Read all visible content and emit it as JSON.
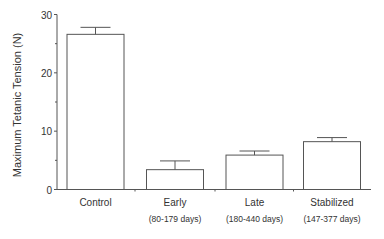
{
  "chart_data": {
    "type": "bar",
    "title": "",
    "xlabel": "",
    "ylabel": "Maximum Tetanic Tension (N)",
    "ylim": [
      0,
      30
    ],
    "yticks": [
      0,
      10,
      20,
      30
    ],
    "grid": false,
    "legend": null,
    "categories": [
      "Control",
      "Early",
      "Late",
      "Stabilized"
    ],
    "sublabels": [
      "",
      "(80-179 days)",
      "(180-440 days)",
      "(147-377 days)"
    ],
    "values": [
      26.6,
      3.4,
      5.9,
      8.2
    ],
    "error_upper": [
      27.8,
      4.9,
      6.6,
      8.9
    ]
  },
  "colors": {
    "axis": "#555555",
    "bar_fill": "#ffffff",
    "bar_stroke": "#555555",
    "text": "#333333"
  }
}
